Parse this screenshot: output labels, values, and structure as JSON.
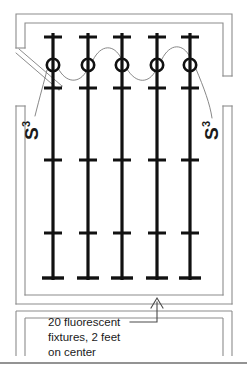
{
  "diagram": {
    "type": "electrical-floor-plan",
    "canvas": {
      "width": 247,
      "height": 372
    },
    "colors": {
      "wall_line": "#8c8c8c",
      "fixture": "#111111",
      "wire": "#7a7a7a",
      "text": "#1a1a1a",
      "background": "#ffffff",
      "footer_rule": "#6f6f6f"
    },
    "room": {
      "name": "room-outline",
      "outer": {
        "x": 16,
        "y": 14,
        "width": 216,
        "height": 290
      },
      "inner": {
        "x": 25,
        "y": 23,
        "width": 198,
        "height": 272
      },
      "wall_style": "double-line",
      "openings": [
        {
          "name": "door-opening-left",
          "side": "left",
          "from_y": 48,
          "to_y": 104
        },
        {
          "name": "opening-right",
          "side": "right",
          "from_y": 76,
          "to_y": 106
        },
        {
          "name": "opening-bottom",
          "side": "bottom",
          "from_x": 28,
          "to_x": 220
        }
      ],
      "door": {
        "name": "door-leaf",
        "from": {
          "x": 20,
          "y": 50
        },
        "to": {
          "x": 64,
          "y": 88
        }
      }
    },
    "fixture_rows": {
      "count": 5,
      "columns_x": [
        53,
        88,
        122,
        157,
        190
      ],
      "top_y": 33,
      "bottom_y": 280,
      "tick_y": [
        37,
        88,
        160,
        233,
        277
      ],
      "tick_half_width": 9,
      "bottom_tick_half_width": 11,
      "row_line_width": 3.2
    },
    "outlets": {
      "name": "junction-box",
      "center_y": 65,
      "radius": 6.2,
      "count": 5
    },
    "wiring": {
      "name": "branch-circuit-wiring",
      "style": "curved-serpentine",
      "stroke": "#7a7a7a",
      "width": 0.9
    },
    "switches": [
      {
        "id": "switch-left",
        "label": "S",
        "subscript": "3",
        "description": "three-way switch",
        "x": 36,
        "y": 128,
        "rotation": -90
      },
      {
        "id": "switch-right",
        "label": "S",
        "subscript": "3",
        "description": "three-way switch",
        "x": 216,
        "y": 128,
        "rotation": -90
      }
    ],
    "annotation": {
      "name": "fixture-note",
      "lines": [
        "20 fluorescent",
        "fixtures, 2 feet",
        "on center"
      ],
      "full_text": "20 fluorescent fixtures, 2 feet on center",
      "text_x": 48,
      "first_line_y": 322,
      "line_height": 15,
      "leader": {
        "name": "leader-line",
        "elbow": {
          "x": 157,
          "y": 322
        },
        "arrow_tip": {
          "x": 157,
          "y": 299
        },
        "horizontal_from_x": 130
      }
    },
    "note_box": {
      "name": "note-frame",
      "x": 22,
      "y": 308,
      "width": 200,
      "height": 48
    },
    "footer_rule": {
      "name": "footer-divider",
      "y": 363
    }
  }
}
